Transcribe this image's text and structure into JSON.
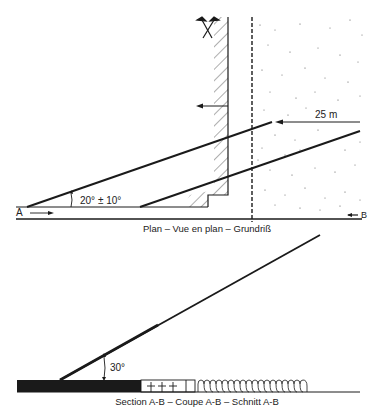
{
  "plan": {
    "caption": "Plan – Vue en plan – Grundriß",
    "angle_label": "20° ± 10°",
    "distance_label": "25 m",
    "point_a": "A",
    "point_b": "B",
    "symbols": [
      "crossed-picks-icon",
      "hatched-wall",
      "dashed-boundary",
      "stippled-area"
    ]
  },
  "section": {
    "caption": "Section A-B – Coupe A-B – Schnitt A-B",
    "angle_label": "30°"
  },
  "colors": {
    "ink": "#1a1a1a",
    "background": "#ffffff"
  }
}
